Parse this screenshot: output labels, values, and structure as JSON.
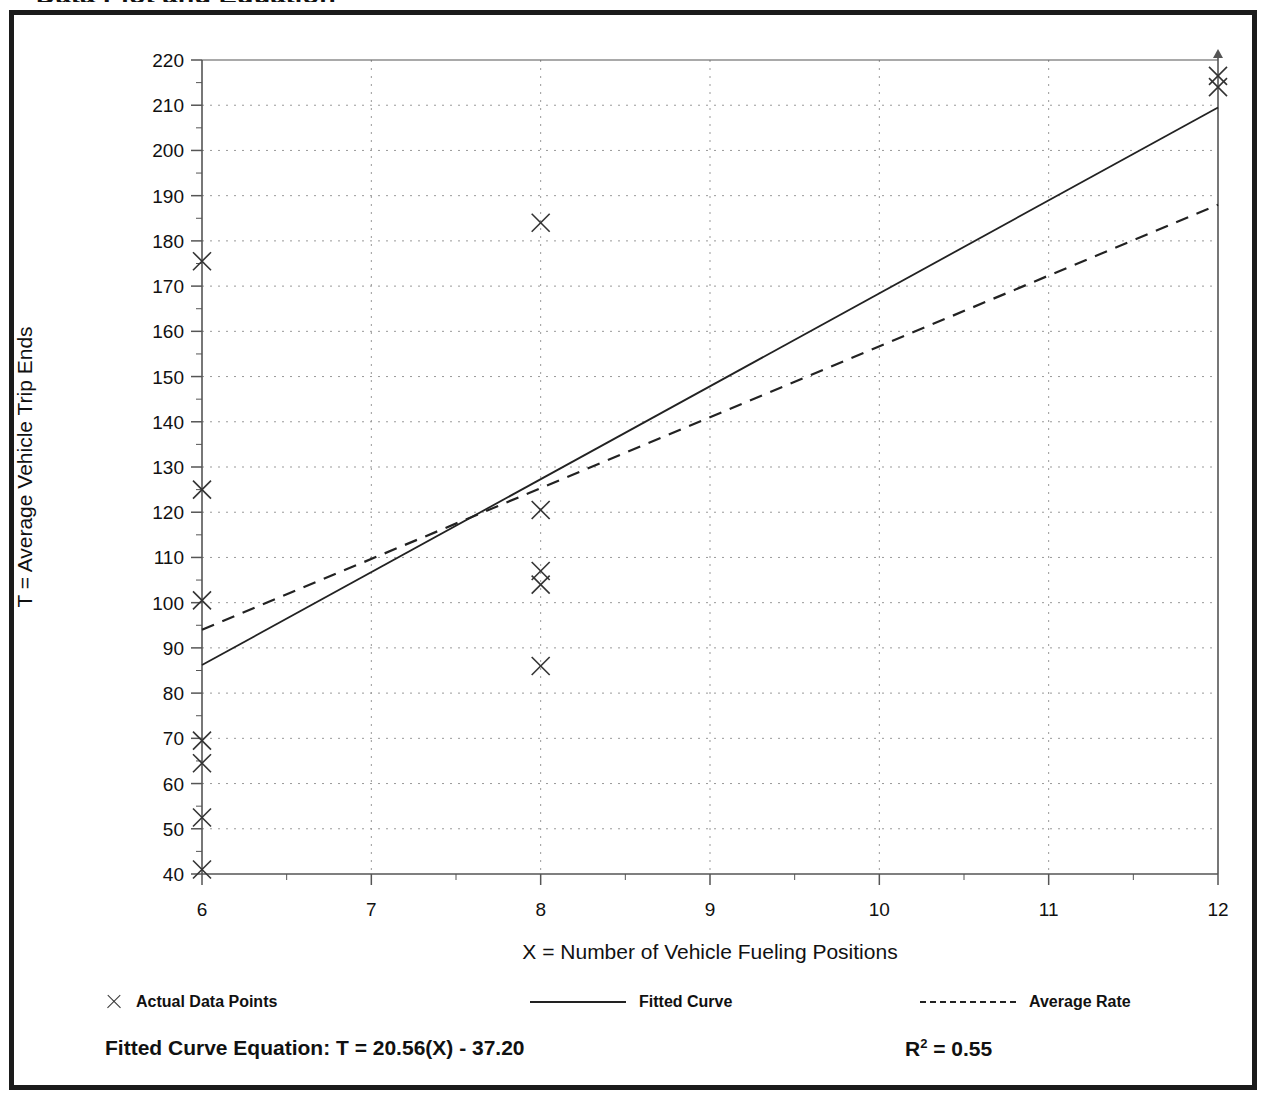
{
  "figure": {
    "title": "Data Plot and Equation"
  },
  "chart_data": {
    "type": "scatter",
    "title": "Data Plot and Equation",
    "xlabel": "X = Number of Vehicle Fueling Positions",
    "ylabel": "T = Average Vehicle Trip Ends",
    "xlim": [
      6,
      12
    ],
    "ylim": [
      40,
      220
    ],
    "xticks": [
      6,
      7,
      8,
      9,
      10,
      11,
      12
    ],
    "yticks": [
      40,
      50,
      60,
      70,
      80,
      90,
      100,
      110,
      120,
      130,
      140,
      150,
      160,
      170,
      180,
      190,
      200,
      210,
      220
    ],
    "x_minor_step": 0.5,
    "y_minor_step": 5,
    "grid": true,
    "legend_position": "below-plot",
    "series": [
      {
        "name": "Actual Data Points",
        "type": "scatter",
        "marker": "x",
        "points": [
          [
            6,
            175.5
          ],
          [
            6,
            125.0
          ],
          [
            6,
            100.5
          ],
          [
            6,
            69.5
          ],
          [
            6,
            64.5
          ],
          [
            6,
            52.5
          ],
          [
            6,
            41.0
          ],
          [
            8,
            184.0
          ],
          [
            8,
            120.5
          ],
          [
            8,
            107.0
          ],
          [
            8,
            104.0
          ],
          [
            8,
            86.0
          ],
          [
            12,
            216.5
          ],
          [
            12,
            214.0
          ]
        ]
      },
      {
        "name": "Fitted Curve",
        "type": "line",
        "style": "solid",
        "endpoints": [
          [
            6,
            86.2
          ],
          [
            12,
            209.5
          ]
        ],
        "equation": "T = 20.56(X) - 37.20",
        "slope": 20.56,
        "intercept": -37.2,
        "r_squared": 0.55
      },
      {
        "name": "Average Rate",
        "type": "line",
        "style": "dashed",
        "endpoints": [
          [
            6,
            94.0
          ],
          [
            12,
            188.0
          ]
        ]
      }
    ]
  },
  "legend": {
    "items": [
      {
        "label": "Actual Data Points",
        "symbol": "cross-marker"
      },
      {
        "label": "Fitted Curve",
        "symbol": "solid-line"
      },
      {
        "label": "Average Rate",
        "symbol": "dashed-line"
      }
    ]
  },
  "equation": {
    "fitted_label": "Fitted Curve Equation:  T = 20.56(X) - 37.20",
    "r_squared_prefix": "R",
    "r_squared_exp": "2",
    "r_squared_value": " = 0.55"
  },
  "colors": {
    "frame": "#1b1b1b",
    "axis": "#555555",
    "grid": "#999999",
    "marker": "#333333",
    "line": "#222222",
    "text": "#111111",
    "background": "#ffffff"
  }
}
